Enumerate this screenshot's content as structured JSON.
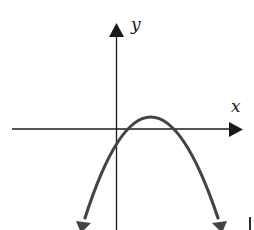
{
  "diagram": {
    "type": "coordinate-plane-parabola",
    "axes": {
      "x_label": "x",
      "y_label": "y",
      "x_axis_arrow": "right",
      "y_axis_arrow": "up"
    },
    "curve": {
      "shape": "parabola",
      "opens": "down",
      "vertex_quadrant": "I",
      "y_intercept_sign": "negative",
      "end_arrows": [
        "down-left",
        "down-right"
      ]
    },
    "colors": {
      "axes": "#1a1a1a",
      "curve": "#444444",
      "background": "#ffffff"
    }
  }
}
